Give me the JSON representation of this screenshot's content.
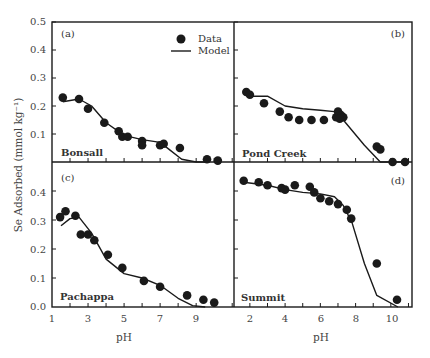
{
  "chart_data": [
    {
      "type": "scatter",
      "panel": "(a)",
      "site": "Bonsall",
      "xlabel": "pH",
      "ylabel": "Se Adsorbed (mmol kg⁻¹)",
      "xlim": [
        1,
        11.1
      ],
      "ylim": [
        0,
        0.5
      ],
      "yticks": [
        0.1,
        0.2,
        0.3,
        0.4,
        0.5
      ],
      "series": [
        {
          "name": "Data",
          "kind": "points",
          "x": [
            1.6,
            2.5,
            3.0,
            3.9,
            4.7,
            4.9,
            5.2,
            6.0,
            6.0,
            7.0,
            7.2,
            8.1,
            9.6,
            10.2
          ],
          "y": [
            0.23,
            0.225,
            0.19,
            0.14,
            0.11,
            0.09,
            0.09,
            0.075,
            0.06,
            0.06,
            0.065,
            0.05,
            0.01,
            0.005
          ]
        },
        {
          "name": "Model",
          "kind": "line",
          "x": [
            1.6,
            2.5,
            3.2,
            4.0,
            5.0,
            6.0,
            7.0,
            7.5,
            8.2,
            9.0,
            9.6
          ],
          "y": [
            0.215,
            0.225,
            0.2,
            0.14,
            0.095,
            0.08,
            0.07,
            0.045,
            0.01,
            0.0,
            0.0
          ]
        }
      ]
    },
    {
      "type": "scatter",
      "panel": "(b)",
      "site": "Pond Creek",
      "xlabel": "pH",
      "ylabel": "Se Adsorbed (mmol kg⁻¹)",
      "xlim": [
        1.1,
        11.2
      ],
      "ylim": [
        0,
        0.5
      ],
      "series": [
        {
          "name": "Data",
          "kind": "points",
          "x": [
            1.8,
            2.0,
            2.8,
            3.7,
            4.2,
            4.8,
            5.5,
            6.2,
            6.9,
            7.0,
            7.1,
            7.2,
            7.3,
            7.1,
            9.2,
            9.4,
            10.1,
            10.8
          ],
          "y": [
            0.25,
            0.24,
            0.21,
            0.18,
            0.16,
            0.15,
            0.15,
            0.15,
            0.16,
            0.18,
            0.17,
            0.165,
            0.16,
            0.155,
            0.055,
            0.045,
            0.0,
            0.0
          ]
        },
        {
          "name": "Model",
          "kind": "line",
          "x": [
            1.9,
            3.0,
            4.0,
            5.0,
            6.0,
            6.8,
            7.3,
            8.5,
            9.4,
            10.8
          ],
          "y": [
            0.235,
            0.235,
            0.2,
            0.19,
            0.185,
            0.18,
            0.15,
            0.06,
            0.0,
            0.0
          ]
        }
      ]
    },
    {
      "type": "scatter",
      "panel": "(c)",
      "site": "Pachappa",
      "xlabel": "pH",
      "ylabel": "Se Adsorbed (mmol kg⁻¹)",
      "xlim": [
        1,
        11.1
      ],
      "ylim": [
        0,
        0.5
      ],
      "xticks": [
        1,
        3,
        5,
        7,
        9
      ],
      "yticks": [
        0.0,
        0.1,
        0.2,
        0.3,
        0.4
      ],
      "series": [
        {
          "name": "Data",
          "kind": "points",
          "x": [
            1.45,
            1.75,
            2.3,
            2.6,
            3.0,
            3.35,
            4.1,
            4.9,
            6.1,
            7.0,
            8.5,
            9.4,
            10.0
          ],
          "y": [
            0.31,
            0.33,
            0.315,
            0.25,
            0.25,
            0.23,
            0.18,
            0.135,
            0.09,
            0.07,
            0.04,
            0.025,
            0.015
          ]
        },
        {
          "name": "Model",
          "kind": "line",
          "x": [
            1.5,
            2.0,
            2.5,
            3.2,
            4.0,
            5.0,
            6.0,
            7.0,
            8.0,
            8.8,
            9.5
          ],
          "y": [
            0.28,
            0.305,
            0.31,
            0.255,
            0.165,
            0.115,
            0.1,
            0.075,
            0.03,
            0.005,
            0.0
          ]
        }
      ]
    },
    {
      "type": "scatter",
      "panel": "(d)",
      "site": "Summit",
      "xlabel": "pH",
      "ylabel": "Se Adsorbed (mmol kg⁻¹)",
      "xlim": [
        1.1,
        11.2
      ],
      "ylim": [
        0,
        0.5
      ],
      "xticks": [
        2,
        4,
        6,
        8,
        10
      ],
      "series": [
        {
          "name": "Data",
          "kind": "points",
          "x": [
            1.65,
            2.5,
            3.0,
            3.8,
            4.0,
            4.55,
            5.4,
            5.65,
            6.0,
            6.5,
            7.0,
            7.5,
            7.75,
            9.2,
            10.35
          ],
          "y": [
            0.435,
            0.43,
            0.42,
            0.41,
            0.405,
            0.42,
            0.415,
            0.395,
            0.375,
            0.365,
            0.355,
            0.335,
            0.305,
            0.15,
            0.025
          ]
        },
        {
          "name": "Model",
          "kind": "line",
          "x": [
            1.65,
            3.0,
            4.0,
            5.0,
            6.0,
            6.8,
            7.3,
            7.8,
            8.5,
            9.2,
            10.4
          ],
          "y": [
            0.43,
            0.42,
            0.405,
            0.395,
            0.39,
            0.38,
            0.35,
            0.29,
            0.15,
            0.04,
            0.0
          ]
        }
      ]
    }
  ],
  "figure": {
    "ylabel": "Se Adsorbed (mmol kg⁻¹)",
    "xlabel_left": "pH",
    "xlabel_right": "pH",
    "legend": {
      "data_label": "Data",
      "model_label": "Model"
    },
    "panels": {
      "a": {
        "tag": "(a)",
        "site": "Bonsall"
      },
      "b": {
        "tag": "(b)",
        "site": "Pond Creek"
      },
      "c": {
        "tag": "(c)",
        "site": "Pachappa"
      },
      "d": {
        "tag": "(d)",
        "site": "Summit"
      }
    },
    "yticks_top": [
      "0.5",
      "0.4",
      "0.3",
      "0.2",
      "0.1"
    ],
    "yticks_bottom": [
      "0.4",
      "0.3",
      "0.2",
      "0.1",
      "0.0"
    ],
    "xticks_left": [
      "1",
      "3",
      "5",
      "7",
      "9"
    ],
    "xticks_right": [
      "2",
      "4",
      "6",
      "8",
      "10"
    ],
    "colors": {
      "ink": "#1a1a1a",
      "text": "#444444",
      "background": "#ffffff"
    }
  }
}
